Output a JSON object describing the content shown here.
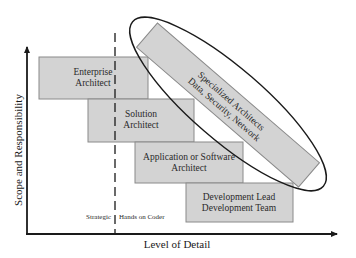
{
  "diagram": {
    "y_axis_label": "Scope and Responsibility",
    "x_axis_label": "Level of Detail",
    "divider_left_label": "Strategic",
    "divider_right_label": "Hands on Coder",
    "roles": [
      {
        "line1": "Enterprise",
        "line2": "Architect"
      },
      {
        "line1": "Solution",
        "line2": "Architect"
      },
      {
        "line1": "Application or Software",
        "line2": "Architect"
      },
      {
        "line1": "Development Lead",
        "line2": "Development Team"
      }
    ],
    "specialized": {
      "line1": "Specialized Architects",
      "line2": "Data, Security, Network"
    },
    "colors": {
      "box_fill": "#d3d3d3",
      "box_stroke": "#8a8a8a",
      "axis": "#1a1a1a"
    }
  }
}
